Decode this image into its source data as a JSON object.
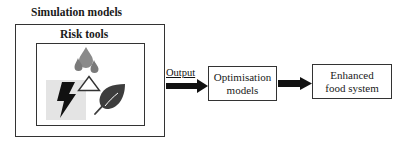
{
  "diagram": {
    "outer_box": {
      "title": "Simulation models"
    },
    "inner_box": {
      "title": "Risk tools",
      "icons": [
        "water-drops-icon",
        "lightning-bolt-icon",
        "triangle-icon",
        "leaf-icon"
      ]
    },
    "arrow_label": "Output",
    "stages": [
      {
        "line1": "Optimisation",
        "line2": "models"
      },
      {
        "line1": "Enhanced",
        "line2": "food system"
      }
    ],
    "colors": {
      "drops": "#8a8a8a",
      "bolt": "#111111",
      "bolt_bg": "#e4e4e4",
      "leaf": "#3d3d3d",
      "border": "#333333"
    }
  }
}
